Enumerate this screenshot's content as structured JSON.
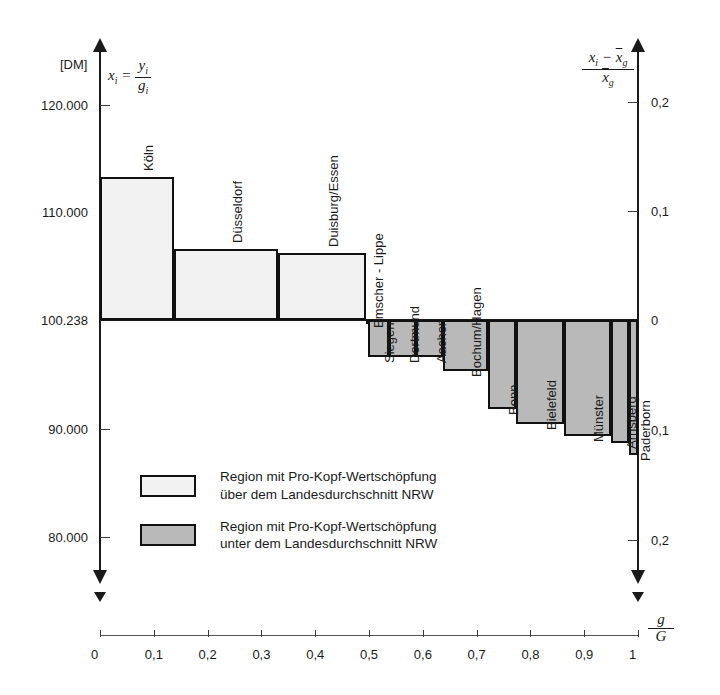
{
  "axes": {
    "y_left": {
      "unit_label": "[DM]",
      "formula_numerator": "y",
      "formula_sub": "i",
      "formula_denominator": "g",
      "formula_lead": "x",
      "ticks": [
        "120.000",
        "110.000",
        "100.238",
        "90.000",
        "80.000"
      ]
    },
    "y_right": {
      "formula_num": "x  −  x",
      "formula_den": "x",
      "ticks_above": [
        "0,2",
        "0,1",
        "0"
      ],
      "ticks_below": [
        "0,1",
        "0,2"
      ]
    },
    "x_bottom": {
      "label_num": "g",
      "label_den": "G",
      "ticks": [
        "0",
        "0,1",
        "0,2",
        "0,3",
        "0,4",
        "0,5",
        "0,6",
        "0,7",
        "0,8",
        "0,9",
        "1"
      ]
    }
  },
  "legend": {
    "above": {
      "line1": "Region mit Pro-Kopf-Wertschöpfung",
      "line2": "über dem Landesdurchschnitt NRW"
    },
    "below": {
      "line1": "Region mit Pro-Kopf-Wertschöpfung",
      "line2": "unter dem Landesdurchschnitt NRW"
    }
  },
  "chart_data": {
    "type": "bar",
    "title": "",
    "subtype": "mosaic / variable-width bar chart (Bruttowertschöpfung pro Kopf, NRW Regionen)",
    "xlabel": "g_i / G",
    "ylabel": "[DM]  x_i = y_i / g_i",
    "y2label": "(x_i - x̄_g) / x̄_g",
    "baseline_value": 100238,
    "baseline_label": "100.238",
    "ylim": [
      80000,
      120000
    ],
    "y2lim": [
      -0.2,
      0.2
    ],
    "xlim": [
      0,
      1
    ],
    "yticks": [
      80000,
      90000,
      100238,
      110000,
      120000
    ],
    "ytick_labels": [
      "80.000",
      "90.000",
      "100.238",
      "110.000",
      "120.000"
    ],
    "y2ticks": [
      -0.2,
      -0.1,
      0,
      0.1,
      0.2
    ],
    "y2tick_labels": [
      "0,2",
      "0,1",
      "0",
      "0,1",
      "0,2"
    ],
    "xticks": [
      0,
      0.1,
      0.2,
      0.3,
      0.4,
      0.5,
      0.6,
      0.7,
      0.8,
      0.9,
      1
    ],
    "xtick_labels": [
      "0",
      "0,1",
      "0,2",
      "0,3",
      "0,4",
      "0,5",
      "0,6",
      "0,7",
      "0,8",
      "0,9",
      "1"
    ],
    "grid": false,
    "legend_position": "inside-lower-left",
    "bars": [
      {
        "label": "Köln",
        "x_start": 0.0,
        "x_end": 0.138,
        "value": 113500,
        "relative": 0.132,
        "group": "above"
      },
      {
        "label": "Düsseldorf",
        "x_start": 0.138,
        "x_end": 0.33,
        "value": 106800,
        "relative": 0.065,
        "group": "above"
      },
      {
        "label": "Duisburg/Essen",
        "x_start": 0.33,
        "x_end": 0.495,
        "value": 106500,
        "relative": 0.062,
        "group": "above"
      },
      {
        "label": "Emscher - Lippe",
        "x_start": 0.495,
        "x_end": 0.498,
        "value": 100238,
        "relative": 0.0,
        "group": "above"
      },
      {
        "label": "Siegen",
        "x_start": 0.498,
        "x_end": 0.537,
        "value": 96800,
        "relative": -0.034,
        "group": "below"
      },
      {
        "label": "Dortmund",
        "x_start": 0.537,
        "x_end": 0.588,
        "value": 96800,
        "relative": -0.034,
        "group": "below"
      },
      {
        "label": "Aachen",
        "x_start": 0.588,
        "x_end": 0.637,
        "value": 96800,
        "relative": -0.034,
        "group": "below"
      },
      {
        "label": "Bochum/Hagen",
        "x_start": 0.637,
        "x_end": 0.721,
        "value": 95500,
        "relative": -0.047,
        "group": "below"
      },
      {
        "label": "Bonn",
        "x_start": 0.721,
        "x_end": 0.773,
        "value": 92000,
        "relative": -0.082,
        "group": "below"
      },
      {
        "label": "Bielefeld",
        "x_start": 0.773,
        "x_end": 0.862,
        "value": 90600,
        "relative": -0.096,
        "group": "below"
      },
      {
        "label": "Münster",
        "x_start": 0.862,
        "x_end": 0.95,
        "value": 89500,
        "relative": -0.107,
        "group": "below"
      },
      {
        "label": "Arnsberg",
        "x_start": 0.95,
        "x_end": 0.984,
        "value": 88900,
        "relative": -0.113,
        "group": "below"
      },
      {
        "label": "Paderborn",
        "x_start": 0.984,
        "x_end": 1.0,
        "value": 87800,
        "relative": -0.124,
        "group": "below"
      }
    ]
  }
}
